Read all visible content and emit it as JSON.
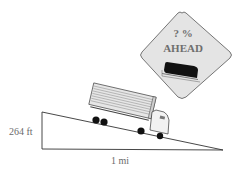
{
  "figure": {
    "type": "grade-problem-illustration",
    "colors": {
      "sign_fill": "#e4e4e4",
      "sign_border": "#555555",
      "sign_text": "#6e6e6e",
      "line": "#333333",
      "truck_body": "#d8d8d8",
      "truck_stripes": "#8a8a8a",
      "wheel": "#111111"
    }
  },
  "sign": {
    "line1": "? %",
    "line2": "AHEAD",
    "icon": "truck-on-incline-icon"
  },
  "triangle": {
    "height_label": "264 ft",
    "base_label": "1 mi"
  },
  "truck": {
    "icon": "semi-truck-icon"
  }
}
